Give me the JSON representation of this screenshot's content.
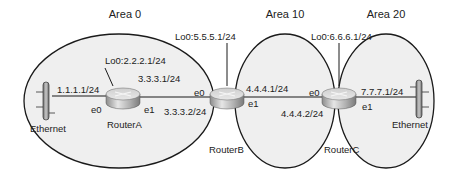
{
  "diagram": {
    "type": "OSPF multi-area network topology",
    "colors": {
      "area_fill": "#efefef",
      "area_stroke": "#1a1a1a",
      "link": "#1a1a1a",
      "router_top": "#d9d9d9",
      "router_side": "#9a9a9a",
      "text": "#222222"
    },
    "areas": [
      {
        "id": "area0",
        "label": "Area 0"
      },
      {
        "id": "area10",
        "label": "Area 10"
      },
      {
        "id": "area20",
        "label": "Area 20"
      }
    ],
    "routers": [
      {
        "id": "routerA",
        "label": "RouterA",
        "loopback": "Lo0:2.2.2.1/24",
        "interfaces": [
          {
            "name": "e0",
            "ip": "1.1.1.1/24"
          },
          {
            "name": "e1",
            "ip": "3.3.3.1/24"
          }
        ]
      },
      {
        "id": "routerB",
        "label": "RouterB",
        "loopback": "Lo0:5.5.5.1/24",
        "interfaces": [
          {
            "name": "e0",
            "ip": "3.3.3.2/24"
          },
          {
            "name": "e1",
            "ip": "4.4.4.1/24"
          }
        ]
      },
      {
        "id": "routerC",
        "label": "RouterC",
        "loopback": "Lo0:6.6.6.1/24",
        "interfaces": [
          {
            "name": "e0",
            "ip": "4.4.4.2/24"
          },
          {
            "name": "e1",
            "ip": "7.7.7.1/24"
          }
        ]
      }
    ],
    "ethernet_segments": [
      {
        "id": "eth-left",
        "label": "Ethernet"
      },
      {
        "id": "eth-right",
        "label": "Ethernet"
      }
    ]
  }
}
